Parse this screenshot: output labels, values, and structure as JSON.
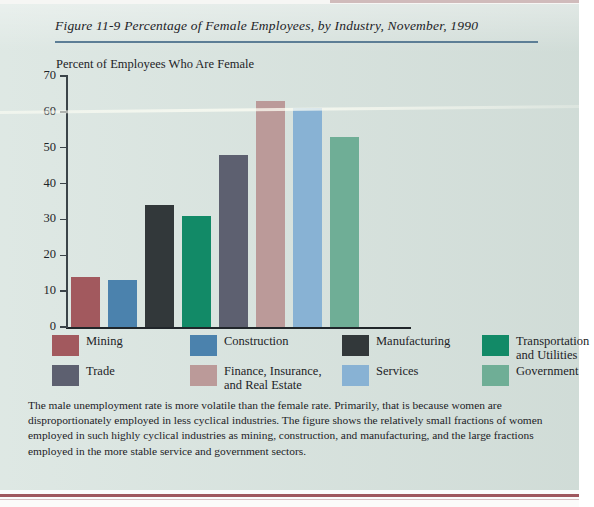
{
  "page": {
    "background_color": "#d7e3de",
    "rule_color": "#5d7e96",
    "bottom_rule_color": "#8e3a41"
  },
  "figure": {
    "label": "Figure 11-9",
    "title": "Figure 11-9   Percentage of Female Employees, by Industry, November, 1990",
    "caption": "The male unemployment rate is more volatile than the female rate. Primarily, that is because women are disproportionately employed in less cyclical industries. The figure shows the relatively small fractions of women employed in such highly cyclical industries as mining, construction, and manufacturing, and the large fractions employed in the more stable service and government sectors."
  },
  "chart_data": {
    "type": "bar",
    "title": "Percentage of Female Employees, by Industry, November, 1990",
    "ylabel": "Percent of Employees Who Are Female",
    "xlabel": "",
    "ylim": [
      0,
      70
    ],
    "yticks": [
      0,
      10,
      20,
      30,
      40,
      50,
      60,
      70
    ],
    "ytick_labels": [
      "0",
      "10",
      "20",
      "30",
      "40",
      "50",
      "60",
      "70"
    ],
    "grid": false,
    "legend_position": "below",
    "categories": [
      "Mining",
      "Construction",
      "Manufacturing",
      "Transportation and Utilities",
      "Trade",
      "Finance, Insurance, and Real Estate",
      "Services",
      "Government"
    ],
    "values": [
      14,
      13,
      34,
      31,
      48,
      63,
      61,
      53
    ],
    "colors": [
      "#a2595e",
      "#4b82ad",
      "#32383a",
      "#128a67",
      "#5d6070",
      "#bb9a99",
      "#88b2d4",
      "#6fae96"
    ]
  },
  "legend": {
    "items": [
      {
        "label": "Mining",
        "color": "#a2595e"
      },
      {
        "label": "Construction",
        "color": "#4b82ad"
      },
      {
        "label": "Manufacturing",
        "color": "#32383a"
      },
      {
        "label": "Transportation and Utilities",
        "color": "#128a67"
      },
      {
        "label": "Trade",
        "color": "#5d6070"
      },
      {
        "label": "Finance, Insurance, and Real Estate",
        "color": "#bb9a99"
      },
      {
        "label": "Services",
        "color": "#88b2d4"
      },
      {
        "label": "Government",
        "color": "#6fae96"
      }
    ]
  }
}
